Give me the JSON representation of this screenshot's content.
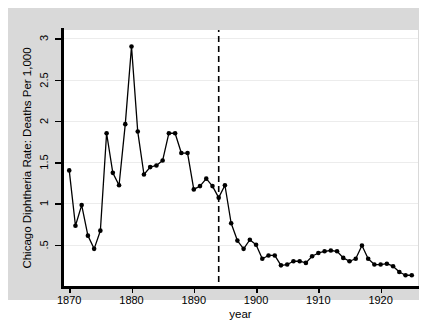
{
  "chart_data": {
    "type": "line",
    "title": "",
    "xlabel": "year",
    "ylabel": "Chicago Diphtheria Rate: Deaths Per 1,000",
    "xlim": [
      1869,
      1926
    ],
    "ylim": [
      0,
      3.1
    ],
    "grid": "horizontal",
    "legend": "none",
    "marker": "filled-circle",
    "xticks": [
      1870,
      1880,
      1890,
      1900,
      1910,
      1920
    ],
    "xtick_labels": [
      "1870",
      "1880",
      "1890",
      "1900",
      "1910",
      "1920"
    ],
    "yticks": [
      0.5,
      1,
      1.5,
      2,
      2.5,
      3
    ],
    "ytick_labels": [
      ".5",
      "1",
      "1.5",
      "2",
      "2.5",
      "3"
    ],
    "annotations": [
      {
        "type": "vertical-dashed-line",
        "name": "reference-line-1894",
        "x": 1894,
        "label": ""
      }
    ],
    "x": [
      1870,
      1871,
      1872,
      1873,
      1874,
      1875,
      1876,
      1877,
      1878,
      1879,
      1880,
      1881,
      1882,
      1883,
      1884,
      1885,
      1886,
      1887,
      1888,
      1889,
      1890,
      1891,
      1892,
      1893,
      1894,
      1895,
      1896,
      1897,
      1898,
      1899,
      1900,
      1901,
      1902,
      1903,
      1904,
      1905,
      1906,
      1907,
      1908,
      1909,
      1910,
      1911,
      1912,
      1913,
      1914,
      1915,
      1916,
      1917,
      1918,
      1919,
      1920,
      1921,
      1922,
      1923,
      1924,
      1925
    ],
    "values": [
      1.4,
      0.73,
      0.98,
      0.61,
      0.45,
      0.67,
      1.85,
      1.37,
      1.22,
      1.96,
      2.9,
      1.87,
      1.35,
      1.44,
      1.46,
      1.52,
      1.85,
      1.85,
      1.61,
      1.61,
      1.17,
      1.21,
      1.3,
      1.21,
      1.07,
      1.22,
      0.76,
      0.55,
      0.45,
      0.56,
      0.5,
      0.33,
      0.37,
      0.37,
      0.25,
      0.26,
      0.3,
      0.3,
      0.28,
      0.36,
      0.4,
      0.42,
      0.43,
      0.42,
      0.34,
      0.3,
      0.33,
      0.49,
      0.33,
      0.26,
      0.26,
      0.27,
      0.24,
      0.17,
      0.13,
      0.13
    ],
    "series_name": "Chicago Diphtheria Rate"
  },
  "colors": {
    "graph_region": "#d9d9d9",
    "plot_background": "#ffffff",
    "axis": "#000000",
    "gridline": "#ececec",
    "series": "#000000",
    "reference_line": "#000000"
  }
}
